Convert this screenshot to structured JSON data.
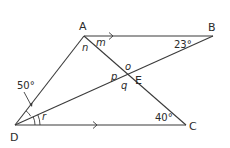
{
  "points": {
    "A": {
      "label": "A",
      "x": 84,
      "y": 36
    },
    "B": {
      "label": "B",
      "x": 213,
      "y": 36
    },
    "C": {
      "label": "C",
      "x": 186,
      "y": 125
    },
    "D": {
      "label": "D",
      "x": 15,
      "y": 125
    },
    "E": {
      "label": "E",
      "x": 127,
      "y": 76
    }
  },
  "segments": [
    "AB",
    "AD",
    "DC",
    "DB",
    "AC"
  ],
  "parallel_marks": [
    "AB",
    "DC"
  ],
  "angle_labels": {
    "ABD": "23°",
    "ADB": "50°",
    "ACD": "40°"
  },
  "variables": {
    "m": "m",
    "n": "n",
    "o": "o",
    "p": "p",
    "q": "q",
    "r": "r"
  },
  "colors": {
    "line": "#3a3a3a",
    "text": "#2b2b2b"
  }
}
